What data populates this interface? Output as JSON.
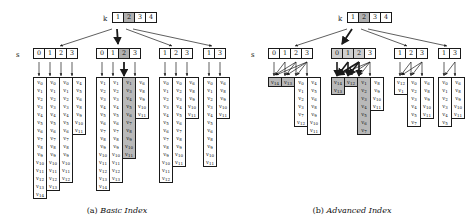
{
  "figure": {
    "row_label_k": "k",
    "row_label_s": "s"
  },
  "panels": [
    {
      "id": "basic",
      "caption_tag": "(a)",
      "caption_text": "Basic Index",
      "k_cells": [
        {
          "label": "1",
          "shaded": false
        },
        {
          "label": "2",
          "shaded": true
        },
        {
          "label": "3",
          "shaded": false
        },
        {
          "label": "4",
          "shaded": false
        }
      ],
      "s_groups": [
        {
          "cells": [
            {
              "label": "0",
              "shaded": false
            },
            {
              "label": "1",
              "shaded": false
            },
            {
              "label": "2",
              "shaded": false
            },
            {
              "label": "3",
              "shaded": false
            }
          ]
        },
        {
          "cells": [
            {
              "label": "0",
              "shaded": false
            },
            {
              "label": "1",
              "shaded": false
            },
            {
              "label": "2",
              "shaded": true
            },
            {
              "label": "3",
              "shaded": false
            }
          ]
        },
        {
          "cells": [
            {
              "label": "1",
              "shaded": false
            },
            {
              "label": "2",
              "shaded": false
            },
            {
              "label": "3",
              "shaded": false
            }
          ]
        },
        {
          "cells": [
            {
              "label": "1",
              "shaded": false
            },
            {
              "label": "3",
              "shaded": false
            }
          ]
        }
      ],
      "value_groups": [
        {
          "columns": [
            {
              "shaded": false,
              "values": [
                "v0",
                "v1",
                "v2",
                "v3",
                "v4",
                "v5",
                "v6",
                "v7",
                "v8",
                "v9",
                "v10",
                "v11",
                "v12",
                "v13",
                "v14"
              ]
            },
            {
              "shaded": false,
              "values": [
                "v0",
                "v1",
                "v2",
                "v3",
                "v4",
                "v5",
                "v6",
                "v7",
                "v8",
                "v9",
                "v10",
                "v11",
                "v12",
                "v13"
              ]
            },
            {
              "shaded": false,
              "values": [
                "v0",
                "v1",
                "v2",
                "v3",
                "v4",
                "v5",
                "v6",
                "v7",
                "v8",
                "v9",
                "v10",
                "v11",
                "v12"
              ]
            },
            {
              "shaded": false,
              "values": [
                "v4",
                "v5",
                "v6",
                "v8",
                "v9",
                "v10",
                "v11"
              ]
            }
          ]
        },
        {
          "columns": [
            {
              "shaded": false,
              "values": [
                "v1",
                "v2",
                "v3",
                "v4",
                "v5",
                "v6",
                "v7",
                "v8",
                "v9",
                "v10",
                "v11",
                "v12",
                "v13",
                "v14"
              ]
            },
            {
              "shaded": false,
              "values": [
                "v1",
                "v2",
                "v3",
                "v4",
                "v5",
                "v6",
                "v7",
                "v8",
                "v9",
                "v10",
                "v11",
                "v12",
                "v13"
              ]
            },
            {
              "shaded": true,
              "values": [
                "v1",
                "v3",
                "v4",
                "v5",
                "v6",
                "v7",
                "v8",
                "v9",
                "v10",
                "v11"
              ]
            },
            {
              "shaded": false,
              "values": [
                "v6",
                "v8",
                "v9",
                "v10",
                "v11"
              ]
            }
          ]
        },
        {
          "columns": [
            {
              "shaded": false,
              "values": [
                "v0",
                "v1",
                "v2",
                "v3",
                "v4",
                "v5",
                "v6",
                "v7",
                "v8",
                "v9",
                "v10",
                "v11",
                "v12"
              ]
            },
            {
              "shaded": false,
              "values": [
                "v0",
                "v2",
                "v3",
                "v4",
                "v5",
                "v6",
                "v7",
                "v8",
                "v9",
                "v10",
                "v11"
              ]
            },
            {
              "shaded": false,
              "values": [
                "v6",
                "v8",
                "v9",
                "v10",
                "v11"
              ]
            }
          ]
        },
        {
          "columns": [
            {
              "shaded": false,
              "values": [
                "v0",
                "v1",
                "v2",
                "v3",
                "v4",
                "v5",
                "v6",
                "v8",
                "v9",
                "v10",
                "v11"
              ]
            },
            {
              "shaded": false,
              "values": [
                "v6",
                "v8",
                "v9",
                "v10",
                "v11"
              ]
            }
          ]
        }
      ]
    },
    {
      "id": "advanced",
      "caption_tag": "(b)",
      "caption_text": "Advanced Index",
      "k_cells": [
        {
          "label": "1",
          "shaded": false
        },
        {
          "label": "2",
          "shaded": true
        },
        {
          "label": "3",
          "shaded": false
        },
        {
          "label": "4",
          "shaded": false
        }
      ],
      "s_groups": [
        {
          "cells": [
            {
              "label": "0",
              "shaded": false
            },
            {
              "label": "1",
              "shaded": false
            },
            {
              "label": "2",
              "shaded": false
            },
            {
              "label": "3",
              "shaded": false
            }
          ]
        },
        {
          "cells": [
            {
              "label": "0",
              "shaded": true
            },
            {
              "label": "1",
              "shaded": true
            },
            {
              "label": "2",
              "shaded": true
            },
            {
              "label": "3",
              "shaded": false
            }
          ]
        },
        {
          "cells": [
            {
              "label": "1",
              "shaded": false
            },
            {
              "label": "2",
              "shaded": false
            },
            {
              "label": "3",
              "shaded": false
            }
          ]
        },
        {
          "cells": [
            {
              "label": "1",
              "shaded": false
            },
            {
              "label": "3",
              "shaded": false
            }
          ]
        }
      ],
      "value_groups": [
        {
          "columns": [
            {
              "shaded": true,
              "values": [
                "v14"
              ]
            },
            {
              "shaded": true,
              "values": [
                "v13"
              ]
            },
            {
              "shaded": false,
              "values": [
                "v0",
                "v1",
                "v2",
                "v3",
                "v7",
                "v12"
              ]
            },
            {
              "shaded": false,
              "values": [
                "v4",
                "v5",
                "v6",
                "v8",
                "v9",
                "v10",
                "v11"
              ]
            }
          ]
        },
        {
          "columns": [
            {
              "shaded": true,
              "values": [
                "v14",
                "v13"
              ]
            },
            {
              "shaded": true,
              "values": [
                "v12"
              ]
            },
            {
              "shaded": true,
              "values": [
                "v1",
                "v2",
                "v3",
                "v4",
                "v5",
                "v6",
                "v7"
              ]
            },
            {
              "shaded": false,
              "values": [
                "v8",
                "v9",
                "v10",
                "v11"
              ]
            }
          ]
        },
        {
          "columns": [
            {
              "shaded": false,
              "values": [
                "v12",
                "v1"
              ]
            },
            {
              "shaded": false,
              "values": [
                "v0",
                "v2",
                "v3",
                "v4",
                "v5",
                "v7"
              ]
            },
            {
              "shaded": false,
              "values": [
                "v6",
                "v8",
                "v9",
                "v10",
                "v11"
              ]
            }
          ]
        },
        {
          "columns": [
            {
              "shaded": false,
              "values": [
                "v0",
                "v1",
                "v2",
                "v3",
                "v4",
                "v5"
              ]
            },
            {
              "shaded": false,
              "values": [
                "v6",
                "v8",
                "v9",
                "v10",
                "v11"
              ]
            }
          ]
        }
      ]
    }
  ]
}
